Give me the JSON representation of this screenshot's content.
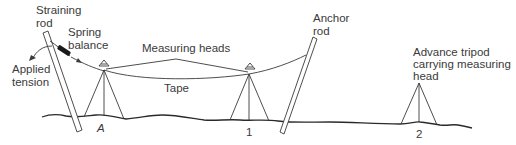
{
  "diagram": {
    "labels": {
      "straining_rod_1": "Straining",
      "straining_rod_2": "rod",
      "spring_balance_1": "Spring",
      "spring_balance_2": "balance",
      "applied_tension_1": "Applied",
      "applied_tension_2": "tension",
      "measuring_heads": "Measuring heads",
      "tape": "Tape",
      "anchor_rod_1": "Anchor",
      "anchor_rod_2": "rod",
      "advance_tripod_1": "Advance tripod",
      "advance_tripod_2": "carrying measuring",
      "advance_tripod_3": "head",
      "station_a": "A",
      "station_1": "1",
      "station_2": "2"
    },
    "colors": {
      "line": "#3a3a3a",
      "ground": "#2a2a2a",
      "spring_balance": "#1a1a1a",
      "background": "#ffffff"
    },
    "components": [
      {
        "name": "Straining rod"
      },
      {
        "name": "Spring balance"
      },
      {
        "name": "Measuring head A"
      },
      {
        "name": "Measuring head 1"
      },
      {
        "name": "Tape"
      },
      {
        "name": "Anchor rod"
      },
      {
        "name": "Advance tripod 2"
      }
    ]
  }
}
